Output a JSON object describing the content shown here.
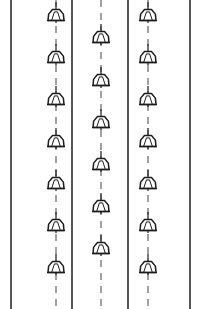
{
  "diagram": {
    "type": "plan-symbol-diagram",
    "canvas": {
      "width": 206,
      "height": 309,
      "background": "#ffffff"
    },
    "colors": {
      "boundary": "#2b2b2b",
      "centerline": "#555555",
      "fixture_outline": "#1c1c1c",
      "fixture_fill": "#ffffff",
      "background": "#ffffff"
    },
    "boundary_lines": [
      {
        "name": "boundary-line-1",
        "x": 11,
        "y1": 0,
        "y2": 309
      },
      {
        "name": "boundary-line-2",
        "x": 72,
        "y1": 0,
        "y2": 309
      },
      {
        "name": "boundary-line-3",
        "x": 128,
        "y1": 0,
        "y2": 309
      },
      {
        "name": "boundary-line-4",
        "x": 190,
        "y1": 0,
        "y2": 309
      }
    ],
    "fixture_runs": [
      {
        "name": "fixture-run-left",
        "label": "Run A",
        "centerline_x": 56,
        "centerline_y1": 0,
        "centerline_y2": 309,
        "fixture_count": 7,
        "fixture_y": [
          15,
          57,
          99,
          141,
          183,
          225,
          267
        ]
      },
      {
        "name": "fixture-run-center",
        "label": "Run B",
        "centerline_x": 101,
        "centerline_y1": 0,
        "centerline_y2": 309,
        "fixture_count": 6,
        "fixture_y": [
          37,
          80,
          122,
          164,
          206,
          248
        ]
      },
      {
        "name": "fixture-run-right",
        "label": "Run C",
        "centerline_x": 148,
        "centerline_y1": 0,
        "centerline_y2": 309,
        "fixture_count": 7,
        "fixture_y": [
          15,
          57,
          99,
          141,
          183,
          225,
          267
        ]
      }
    ],
    "fixture_symbol": {
      "name": "lamp-fixture-icon",
      "description": "bell-shaped pendant luminaire on centerline",
      "body_half_width": 8,
      "body_top_half_width": 3.5,
      "body_height": 11,
      "base_half_width": 9,
      "stem_above": 13,
      "stem_below": 8
    }
  }
}
